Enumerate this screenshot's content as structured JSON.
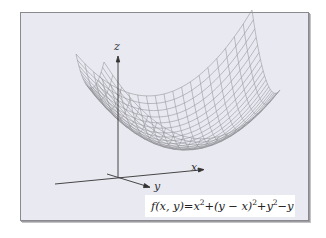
{
  "figure": {
    "background_color": "#e9e9f1",
    "formula_background": "#ffffff",
    "surface_color": "#8a8a8a",
    "axis_color": "#333333"
  },
  "axes": {
    "x_label": "x",
    "y_label": "y",
    "z_label": "z"
  },
  "formula": {
    "lhs": "f(x, y)",
    "equals": "=",
    "t1_base": "x",
    "t1_exp": "2",
    "plus1": "+",
    "t2_base": "(y − x)",
    "t2_exp": "2",
    "plus2": "+",
    "t3_base": "y",
    "t3_exp": "2",
    "minus": "−",
    "t4": "y",
    "full_text": "f(x, y) = x² + (y − x)² + y² − y"
  },
  "surface": {
    "type": "wireframe-paraboloid",
    "grid_lines_u": 20,
    "grid_lines_v": 20
  }
}
